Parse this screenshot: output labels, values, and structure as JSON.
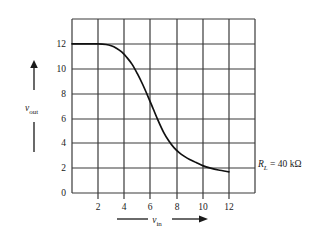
{
  "figure": {
    "background": "#ffffff",
    "line_color": "#1a1a1a",
    "grid_color": "#3a3a3a"
  },
  "chart_data": {
    "type": "line",
    "title": "",
    "subtitle": "",
    "xlabel": "v_in",
    "ylabel": "v_out",
    "xlabel_base": "v",
    "xlabel_sub": "in",
    "ylabel_base": "v",
    "ylabel_sub": "out",
    "xlim": [
      0,
      14
    ],
    "ylim": [
      0,
      14
    ],
    "xticks": [
      2,
      4,
      6,
      8,
      10,
      12
    ],
    "xtick_labels": [
      "2",
      "4",
      "6",
      "8",
      "10",
      "12"
    ],
    "yticks": [
      0,
      2,
      4,
      6,
      8,
      10,
      12
    ],
    "ytick_labels": [
      "0",
      "2",
      "4",
      "6",
      "8",
      "10",
      "12"
    ],
    "grid": true,
    "grid_x": [
      0,
      2,
      4,
      6,
      8,
      10,
      12,
      14
    ],
    "grid_y": [
      0,
      2,
      4,
      6,
      8,
      10,
      12,
      14
    ],
    "legend": "none",
    "series": [
      {
        "name": "transfer-characteristic",
        "x": [
          0.0,
          1.0,
          2.0,
          2.6,
          3.0,
          3.4,
          3.8,
          4.2,
          4.6,
          5.0,
          5.4,
          5.8,
          6.2,
          6.6,
          7.0,
          7.4,
          7.8,
          8.2,
          8.6,
          9.0,
          9.5,
          10.0,
          10.6,
          11.2,
          12.0
        ],
        "y": [
          12.0,
          12.0,
          12.0,
          11.95,
          11.85,
          11.65,
          11.35,
          10.9,
          10.35,
          9.6,
          8.75,
          7.8,
          6.8,
          5.8,
          4.9,
          4.2,
          3.65,
          3.25,
          2.95,
          2.7,
          2.45,
          2.2,
          2.0,
          1.85,
          1.7
        ]
      }
    ],
    "annotations": [
      {
        "name": "load-resistance",
        "text": "R_L = 40 kΩ",
        "symbol": "R",
        "symbol_sub": "L",
        "value": "= 40 kΩ",
        "x_px": 258,
        "y_px": 163
      }
    ]
  },
  "axis_arrows": {
    "y_arrow": "up-arrow",
    "x_arrow": "right-arrow"
  }
}
